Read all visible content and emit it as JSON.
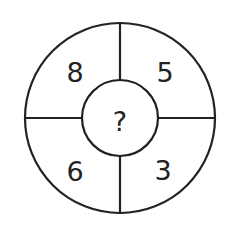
{
  "puzzle": {
    "type": "number-wheel",
    "center": "?",
    "segments": {
      "top_left": "8",
      "top_right": "5",
      "bottom_left": "6",
      "bottom_right": "3"
    }
  },
  "colors": {
    "stroke": "#222222",
    "background": "#ffffff"
  }
}
